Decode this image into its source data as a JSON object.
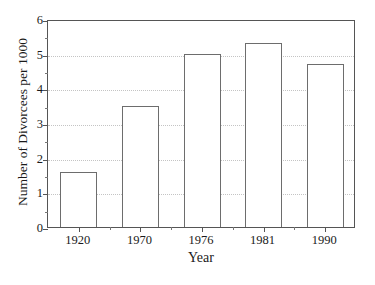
{
  "chart_data": {
    "type": "bar",
    "title": "",
    "subtitle": "",
    "xlabel": "Year",
    "ylabel": "Number of Divorcees per 1000",
    "categories": [
      "1920",
      "1970",
      "1976",
      "1981",
      "1990"
    ],
    "values": [
      1.6,
      3.5,
      5.0,
      5.3,
      4.7
    ],
    "series": [
      {
        "name": "Number of Divorcees per 1000",
        "values": [
          1.6,
          3.5,
          5.0,
          5.3,
          4.7
        ]
      }
    ],
    "ylim": [
      0,
      6
    ],
    "y_ticks": [
      "0",
      "1",
      "2",
      "3",
      "4",
      "5",
      "6"
    ],
    "y_tick_values": [
      0,
      1,
      2,
      3,
      4,
      5,
      6
    ],
    "y_minor_tick_values": [
      0.5,
      1.5,
      2.5,
      3.5,
      4.5,
      5.5
    ],
    "grid": true,
    "grid_axis": "y",
    "grid_style": "dotted",
    "legend": false,
    "legend_position": "none",
    "annotations": [],
    "colors": {
      "bar_fill": "#ffffff",
      "bar_stroke": "#6d6d6d",
      "axis": "#555555",
      "grid": "#c4c4c4",
      "text": "#1a1a1a",
      "background": "#ffffff"
    }
  }
}
